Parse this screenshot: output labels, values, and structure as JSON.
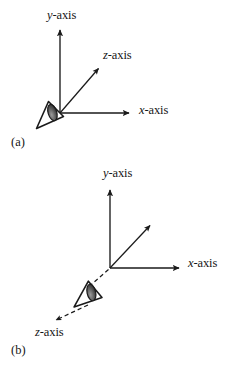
{
  "figure": {
    "background_color": "#ffffff",
    "ink_color": "#1a1a1a",
    "width": 232,
    "height": 365
  },
  "panels": [
    {
      "id": "a",
      "caption": "(a)",
      "origin": {
        "x": 60,
        "y": 113
      },
      "axes": [
        {
          "name": "y-axis",
          "label_prefix": "y",
          "label_suffix": "-axis",
          "style": "solid",
          "direction": "up",
          "tip": {
            "x": 60,
            "y": 26
          },
          "label_pos": {
            "x": 47,
            "y": 9
          }
        },
        {
          "name": "z-axis",
          "label_prefix": "z",
          "label_suffix": "-axis",
          "style": "solid",
          "direction": "up-right-diagonal",
          "tip": {
            "x": 100,
            "y": 66
          },
          "label_pos": {
            "x": 103,
            "y": 49
          }
        },
        {
          "name": "x-axis",
          "label_prefix": "x",
          "label_suffix": "-axis",
          "style": "solid",
          "direction": "right",
          "tip": {
            "x": 133,
            "y": 113
          },
          "label_pos": {
            "x": 139,
            "y": 104
          }
        }
      ],
      "viewer": {
        "name": "eye-icon",
        "description": "eye and viewing cone pointing toward origin",
        "apex": {
          "x": 33,
          "y": 131
        },
        "looking_toward": "origin"
      }
    },
    {
      "id": "b",
      "caption": "(b)",
      "origin": {
        "x": 110,
        "y": 268
      },
      "axes": [
        {
          "name": "y-axis",
          "label_prefix": "y",
          "label_suffix": "-axis",
          "style": "solid",
          "direction": "up",
          "tip": {
            "x": 110,
            "y": 186
          },
          "label_pos": {
            "x": 103,
            "y": 167
          }
        },
        {
          "name": "x-axis",
          "label_prefix": "x",
          "label_suffix": "-axis",
          "style": "solid",
          "direction": "right",
          "tip": {
            "x": 183,
            "y": 268
          },
          "label_pos": {
            "x": 188,
            "y": 257
          }
        },
        {
          "name": "unlabeled-diagonal-axis",
          "label_prefix": "",
          "label_suffix": "",
          "style": "solid",
          "direction": "up-right-diagonal",
          "tip": {
            "x": 152,
            "y": 223
          },
          "label_pos": null
        },
        {
          "name": "z-axis",
          "label_prefix": "z",
          "label_suffix": "-axis",
          "style": "dashed",
          "direction": "down-left-diagonal",
          "tip": {
            "x": 52,
            "y": 323
          },
          "label_pos": {
            "x": 35,
            "y": 326
          }
        }
      ],
      "viewer": {
        "name": "eye-icon",
        "description": "eye and viewing cone on the dashed z-axis looking toward origin",
        "apex": {
          "x": 68,
          "y": 312
        },
        "looking_toward": "origin"
      }
    }
  ]
}
